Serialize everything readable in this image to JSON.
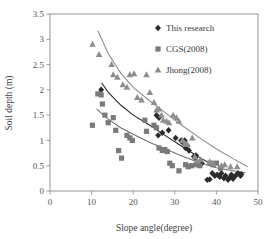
{
  "chart_data": {
    "type": "scatter",
    "title": "",
    "xlabel": "Slope angle(degree)",
    "ylabel": "Soil depth (m)",
    "xlim": [
      0,
      50
    ],
    "ylim": [
      0,
      3.5
    ],
    "xticks": [
      "0",
      "10",
      "20",
      "30",
      "40",
      "50"
    ],
    "yticks": [
      "0",
      "0.5",
      "1",
      "1.5",
      "2",
      "2.5",
      "3",
      "3.5"
    ],
    "xtick_values": [
      0,
      10,
      20,
      30,
      40,
      50
    ],
    "ytick_values": [
      0,
      0.5,
      1,
      1.5,
      2,
      2.5,
      3,
      3.5
    ],
    "grid": false,
    "legend_position": "top-right",
    "series": [
      {
        "name": "This research",
        "marker": "diamond",
        "color": "#2b2b2b",
        "points": [
          [
            12.3,
            2.0
          ],
          [
            25.6,
            1.5
          ],
          [
            26.2,
            1.45
          ],
          [
            26.0,
            1.1
          ],
          [
            27.0,
            1.15
          ],
          [
            28.5,
            1.2
          ],
          [
            30.2,
            1.05
          ],
          [
            31.5,
            1.0
          ],
          [
            32.0,
            0.95
          ],
          [
            32.4,
            1.0
          ],
          [
            32.6,
            0.85
          ],
          [
            33.0,
            0.9
          ],
          [
            33.4,
            0.8
          ],
          [
            34.6,
            0.68
          ],
          [
            34.9,
            0.66
          ],
          [
            35.1,
            0.7
          ],
          [
            36.5,
            0.55
          ],
          [
            37.8,
            0.22
          ],
          [
            38.4,
            0.23
          ],
          [
            39.0,
            0.35
          ],
          [
            39.6,
            0.3
          ],
          [
            40.2,
            0.32
          ],
          [
            40.8,
            0.28
          ],
          [
            41.2,
            0.35
          ],
          [
            41.8,
            0.25
          ],
          [
            42.2,
            0.3
          ],
          [
            42.8,
            0.22
          ],
          [
            43.2,
            0.26
          ],
          [
            43.6,
            0.32
          ],
          [
            44.0,
            0.24
          ],
          [
            44.6,
            0.3
          ],
          [
            45.2,
            0.35
          ],
          [
            45.8,
            0.3
          ],
          [
            46.0,
            0.33
          ]
        ]
      },
      {
        "name": "CGS(2008)",
        "marker": "square",
        "color": "#7a7a7a",
        "points": [
          [
            10.2,
            1.3
          ],
          [
            11.5,
            1.92
          ],
          [
            12.3,
            1.9
          ],
          [
            12.6,
            1.72
          ],
          [
            13.2,
            1.5
          ],
          [
            14.0,
            1.35
          ],
          [
            15.2,
            1.45
          ],
          [
            15.8,
            1.2
          ],
          [
            16.5,
            0.8
          ],
          [
            17.2,
            0.65
          ],
          [
            18.5,
            1.1
          ],
          [
            19.2,
            1.05
          ],
          [
            19.8,
            1.0
          ],
          [
            22.8,
            1.4
          ],
          [
            23.2,
            1.18
          ],
          [
            25.0,
            1.3
          ],
          [
            25.6,
            1.25
          ],
          [
            26.2,
            0.85
          ],
          [
            27.0,
            0.8
          ],
          [
            27.6,
            0.82
          ],
          [
            28.2,
            0.78
          ],
          [
            28.8,
            0.55
          ],
          [
            29.4,
            0.5
          ],
          [
            31.0,
            0.4
          ],
          [
            32.6,
            0.52
          ],
          [
            33.2,
            0.48
          ],
          [
            34.0,
            0.5
          ],
          [
            35.2,
            0.52
          ],
          [
            36.0,
            0.5
          ],
          [
            38.5,
            0.55
          ],
          [
            39.2,
            0.52
          ],
          [
            40.0,
            0.55
          ],
          [
            41.0,
            0.45
          ]
        ]
      },
      {
        "name": "Jhong(2008)",
        "marker": "triangle",
        "color": "#8e8e8e",
        "points": [
          [
            10.2,
            2.9
          ],
          [
            11.8,
            2.7
          ],
          [
            14.8,
            2.5
          ],
          [
            15.2,
            2.3
          ],
          [
            16.2,
            2.25
          ],
          [
            17.5,
            2.1
          ],
          [
            18.5,
            2.05
          ],
          [
            19.2,
            2.3
          ],
          [
            20.2,
            2.32
          ],
          [
            21.0,
            1.85
          ],
          [
            22.0,
            1.8
          ],
          [
            23.2,
            2.3
          ],
          [
            24.0,
            1.95
          ],
          [
            25.0,
            1.75
          ],
          [
            25.6,
            1.6
          ],
          [
            26.2,
            1.62
          ],
          [
            26.8,
            1.5
          ],
          [
            27.2,
            1.4
          ],
          [
            28.0,
            1.38
          ],
          [
            28.6,
            1.35
          ],
          [
            29.6,
            1.5
          ],
          [
            30.4,
            1.45
          ],
          [
            31.0,
            1.38
          ],
          [
            31.8,
            1.0
          ],
          [
            32.4,
            0.95
          ],
          [
            33.0,
            0.92
          ],
          [
            34.2,
            1.05
          ],
          [
            34.8,
            0.68
          ],
          [
            35.4,
            0.6
          ],
          [
            36.2,
            0.62
          ],
          [
            38.4,
            0.58
          ],
          [
            39.2,
            0.55
          ],
          [
            41.2,
            0.5
          ],
          [
            42.0,
            0.52
          ],
          [
            43.4,
            0.48
          ],
          [
            45.0,
            0.48
          ]
        ]
      }
    ],
    "trendlines": [
      {
        "name": "jhong-trend",
        "color": "#8e8e8e",
        "path": [
          [
            11.5,
            3.17
          ],
          [
            14,
            2.72
          ],
          [
            17,
            2.33
          ],
          [
            20,
            2.05
          ],
          [
            24,
            1.78
          ],
          [
            28,
            1.53
          ],
          [
            32,
            1.28
          ],
          [
            36,
            1.05
          ],
          [
            40,
            0.83
          ],
          [
            44,
            0.64
          ],
          [
            47.5,
            0.48
          ]
        ]
      },
      {
        "name": "this-research-trend",
        "color": "#2b2b2b",
        "path": [
          [
            12.4,
            2.14
          ],
          [
            14,
            1.95
          ],
          [
            17,
            1.7
          ],
          [
            20,
            1.5
          ],
          [
            24,
            1.3
          ],
          [
            28,
            1.08
          ],
          [
            31,
            0.92
          ],
          [
            34,
            0.76
          ],
          [
            36,
            0.66
          ],
          [
            38,
            0.57
          ]
        ]
      },
      {
        "name": "cgs-trend",
        "color": "#6f6f6f",
        "path": [
          [
            11.2,
            1.62
          ],
          [
            14,
            1.42
          ],
          [
            17,
            1.25
          ],
          [
            20,
            1.12
          ],
          [
            24,
            0.96
          ],
          [
            28,
            0.82
          ],
          [
            32,
            0.68
          ],
          [
            36,
            0.56
          ],
          [
            40,
            0.46
          ],
          [
            44,
            0.4
          ],
          [
            47,
            0.36
          ]
        ]
      }
    ]
  },
  "legend": {
    "items": [
      {
        "label": "This research",
        "marker": "diamond",
        "color": "#2b2b2b"
      },
      {
        "label": "CGS(2008)",
        "marker": "square",
        "color": "#7a7a7a"
      },
      {
        "label": "Jhong(2008)",
        "marker": "triangle",
        "color": "#8e8e8e"
      }
    ]
  },
  "axes": {
    "x_title": "Slope angle(degree)",
    "y_title": "Soil depth (m)"
  }
}
